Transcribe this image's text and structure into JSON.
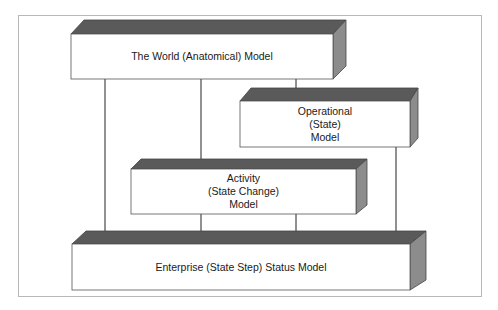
{
  "diagram": {
    "type": "block-flow",
    "colors": {
      "top_face": "#5a5a5a",
      "side_face": "#8c8c8c",
      "front_face": "#ffffff",
      "outline": "#555555",
      "arrow": "#222222",
      "frame": "#b8b8b8"
    },
    "boxes": [
      {
        "id": "world",
        "lines": [
          "The World (Anatomical) Model"
        ]
      },
      {
        "id": "operational",
        "lines": [
          "Operational",
          "(State)",
          "Model"
        ]
      },
      {
        "id": "activity",
        "lines": [
          "Activity",
          "(State Change)",
          "Model"
        ]
      },
      {
        "id": "enterprise",
        "lines": [
          "Enterprise (State Step) Status Model"
        ]
      }
    ],
    "edges": [
      {
        "from": "world",
        "to": "enterprise"
      },
      {
        "from": "world",
        "to": "activity"
      },
      {
        "from": "world",
        "to": "operational"
      },
      {
        "from": "activity",
        "to": "enterprise"
      },
      {
        "from": "activity",
        "to": "enterprise"
      },
      {
        "from": "operational",
        "to": "enterprise"
      }
    ]
  }
}
